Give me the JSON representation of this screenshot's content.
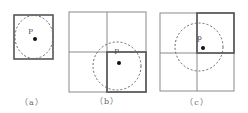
{
  "panels": [
    {
      "id": "a",
      "label": "（a）",
      "point_label": "P"
    },
    {
      "id": "b",
      "label": "（b）",
      "point_label": "P"
    },
    {
      "id": "c",
      "label": "（c）",
      "point_label": "p"
    }
  ],
  "colors": {
    "grid": "#8a8a8a",
    "bold": "#555555",
    "circle": "#666666",
    "point": "#111111",
    "label": "#666666"
  }
}
